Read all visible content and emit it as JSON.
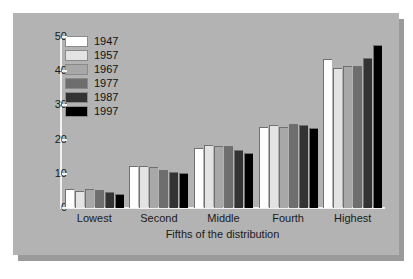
{
  "chart_data": {
    "type": "bar",
    "title": "",
    "xlabel": "Fifths of the distribution",
    "ylabel": "",
    "categories": [
      "Lowest",
      "Second",
      "Middle",
      "Fourth",
      "Highest"
    ],
    "ylim": [
      0,
      50
    ],
    "yticks": [
      0,
      10,
      20,
      30,
      40,
      50
    ],
    "grid": false,
    "legend_position": "upper-left",
    "series": [
      {
        "name": "1947",
        "color": "#ffffff",
        "values": [
          5.5,
          12.2,
          17.5,
          23.6,
          43.5
        ]
      },
      {
        "name": "1957",
        "color": "#e3e3e3",
        "values": [
          5.1,
          12.3,
          18.5,
          24.2,
          40.8
        ]
      },
      {
        "name": "1967",
        "color": "#a8a8a8",
        "values": [
          5.6,
          12.1,
          18.0,
          23.8,
          41.5
        ]
      },
      {
        "name": "1977",
        "color": "#6e6e6e",
        "values": [
          5.4,
          11.0,
          18.0,
          24.5,
          41.4
        ]
      },
      {
        "name": "1987",
        "color": "#333333",
        "values": [
          4.7,
          10.6,
          17.0,
          24.2,
          44.0
        ]
      },
      {
        "name": "1997",
        "color": "#000000",
        "values": [
          4.2,
          10.2,
          16.0,
          23.4,
          47.6
        ]
      }
    ]
  },
  "colors": {
    "panel_background": "#b3b3b3",
    "panel_shadow": "#9a9a9a",
    "page_background": "#ffffff",
    "axis": "#f2f2f2",
    "text": "#1a1a1a"
  }
}
